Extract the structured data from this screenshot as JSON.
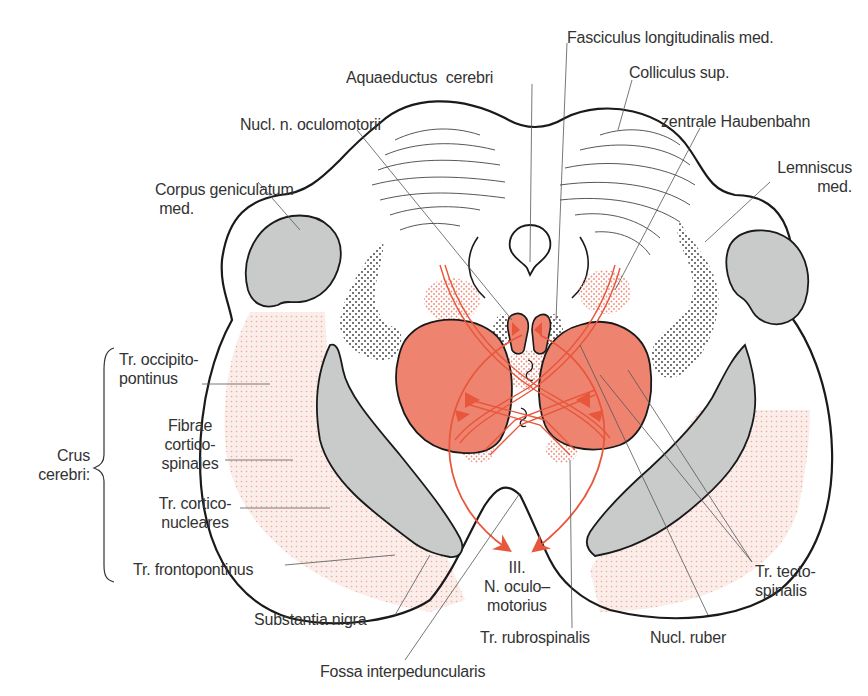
{
  "figure": {
    "colors": {
      "outline": "#1a1a1a",
      "gray_fill": "#c9cbcb",
      "red_fill": "#ee8470",
      "red_line": "#e8573c",
      "pink_stipple": "#f2b5a8",
      "leader": "#555555",
      "text": "#333333"
    }
  },
  "labels": {
    "aquaeductus": "Aquaeductus  cerebri",
    "fasciculus": "Fasciculus longitudinalis med.",
    "colliculus": "Colliculus sup.",
    "nucl_oculomotorii": "Nucl. n. oculomotorii",
    "zentrale_haubenbahn": "zentrale Haubenbahn",
    "corpus_geniculatum": "Corpus geniculatum\n med.",
    "lemniscus": "Lemniscus\nmed.",
    "crus_cerebri": "Crus\ncerebri:",
    "tr_occipito": "Tr. occipito-\npontinus",
    "fibrae_cortico": "Fibrae\ncortico-\nspinales",
    "tr_cortico_nucl": "Tr. cortico-\nnucleares",
    "tr_fronto": "Tr. frontopontinus",
    "substantia_nigra": "Substantia nigra",
    "fossa": "Fossa interpeduncularis",
    "n_oculomotorius": "III.\nN. oculo–\nmotorius",
    "tr_rubro": "Tr. rubrospinalis",
    "nucl_ruber": "Nucl. ruber",
    "tr_tecto": "Tr. tecto-\nspinalis"
  }
}
